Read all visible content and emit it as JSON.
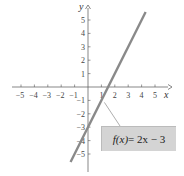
{
  "chart_data": {
    "type": "line",
    "title": "",
    "xlabel": "x",
    "ylabel": "y",
    "xlim": [
      -5.5,
      5.5
    ],
    "ylim": [
      -6,
      6
    ],
    "x_ticks": [
      -5,
      -4,
      -3,
      -2,
      -1,
      1,
      2,
      3,
      4,
      5
    ],
    "y_ticks": [
      -5,
      -4,
      -3,
      -2,
      -1,
      1,
      2,
      3,
      4,
      5
    ],
    "grid": false,
    "series": [
      {
        "name": "f(x) = 2x - 3",
        "equation": "f(x) = 2x - 3",
        "slope": 2,
        "intercept": -3,
        "x": [
          -1.3,
          4.3
        ],
        "values": [
          -5.6,
          5.6
        ],
        "color": "#8a8a8a"
      }
    ],
    "annotations": [
      {
        "text": "f(x) = 2x − 3",
        "points_to": [
          1,
          -1
        ]
      }
    ]
  },
  "labels": {
    "x_axis": "x",
    "y_axis": "y",
    "equation_fx": "f(x)",
    "equation_rest": " = 2x − 3"
  },
  "colors": {
    "line": "#8a8a8a",
    "axis": "#555555",
    "label_box": "#d4d4d4"
  }
}
